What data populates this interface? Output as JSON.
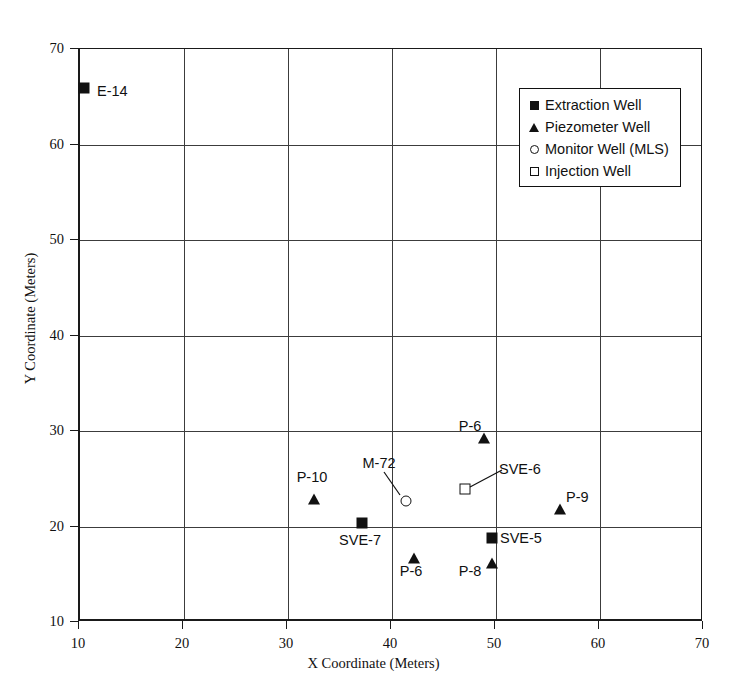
{
  "chart_data": {
    "type": "scatter",
    "title": "",
    "xlabel": "X Coordinate (Meters)",
    "ylabel": "Y Coordinate (Meters)",
    "xlim": [
      10,
      70
    ],
    "ylim": [
      10,
      70
    ],
    "xticks": [
      10,
      20,
      30,
      40,
      50,
      60,
      70
    ],
    "yticks": [
      10,
      20,
      30,
      40,
      50,
      60,
      70
    ],
    "xtick_labels": [
      "10",
      "20",
      "30",
      "40",
      "50",
      "60",
      "70"
    ],
    "ytick_labels": [
      "10",
      "20",
      "30",
      "40",
      "50",
      "60",
      "70"
    ],
    "grid": true,
    "grid_x_at": [
      20,
      30,
      40,
      50,
      60
    ],
    "grid_y_at": [
      20,
      30,
      40,
      50,
      60
    ],
    "legend_position": "upper right",
    "series": [
      {
        "name": "Extraction Well",
        "marker": "filled-square",
        "points": [
          {
            "label": "E-14",
            "x": 10.4,
            "y": 65.9
          },
          {
            "label": "SVE-7",
            "x": 37.1,
            "y": 20.4
          },
          {
            "label": "SVE-5",
            "x": 49.6,
            "y": 18.8
          }
        ]
      },
      {
        "name": "Piezometer Well",
        "marker": "filled-triangle",
        "points": [
          {
            "label": "P-10",
            "x": 32.5,
            "y": 22.9
          },
          {
            "label": "P-6",
            "x": 48.8,
            "y": 29.3
          },
          {
            "label": "P-9",
            "x": 56.2,
            "y": 21.8
          },
          {
            "label": "P-6",
            "x": 42.1,
            "y": 16.7
          },
          {
            "label": "P-8",
            "x": 49.6,
            "y": 16.2
          }
        ]
      },
      {
        "name": "Monitor Well (MLS)",
        "marker": "open-circle",
        "points": [
          {
            "label": "M-72",
            "x": 41.3,
            "y": 22.7
          }
        ]
      },
      {
        "name": "Injection Well",
        "marker": "open-square",
        "points": [
          {
            "label": "SVE-6",
            "x": 47.0,
            "y": 23.9
          }
        ]
      }
    ],
    "point_labels": [
      {
        "text": "E-14",
        "x": 97,
        "y": 83,
        "align": "left"
      },
      {
        "text": "P-10",
        "x": 312,
        "y": 469,
        "align": "center"
      },
      {
        "text": "M-72",
        "x": 379,
        "y": 455,
        "align": "center"
      },
      {
        "text": "SVE-6",
        "x": 499,
        "y": 461,
        "align": "left"
      },
      {
        "text": "P-6",
        "x": 470,
        "y": 418,
        "align": "center"
      },
      {
        "text": "P-9",
        "x": 566,
        "y": 489,
        "align": "left"
      },
      {
        "text": "SVE-7",
        "x": 360,
        "y": 532,
        "align": "center"
      },
      {
        "text": "SVE-5",
        "x": 500,
        "y": 530,
        "align": "left"
      },
      {
        "text": "P-6",
        "x": 411,
        "y": 563,
        "align": "center"
      },
      {
        "text": "P-8",
        "x": 470,
        "y": 563,
        "align": "center"
      }
    ],
    "leader_lines": [
      {
        "name": "m72-leader",
        "x1": 384,
        "y1": 472,
        "x2": 400,
        "y2": 495
      },
      {
        "name": "sve6-leader",
        "x1": 470,
        "y1": 487,
        "x2": 502,
        "y2": 470
      }
    ]
  },
  "legend": {
    "items": [
      {
        "label": "Extraction Well",
        "marker": "filled-square"
      },
      {
        "label": "Piezometer Well",
        "marker": "filled-triangle"
      },
      {
        "label": "Monitor Well (MLS)",
        "marker": "open-circle"
      },
      {
        "label": "Injection Well",
        "marker": "open-square"
      }
    ]
  },
  "colors": {
    "ink": "#111111",
    "grid": "#3c3c3c",
    "background": "#ffffff"
  }
}
